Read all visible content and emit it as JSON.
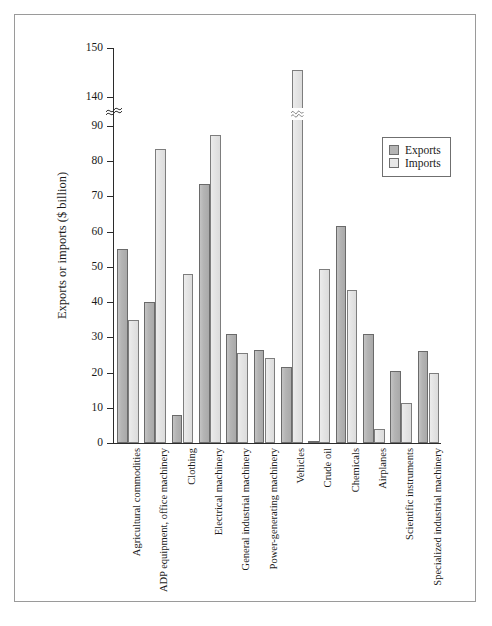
{
  "figure": {
    "y_axis_title": "Exports or imports ($ billion)"
  },
  "legend": {
    "position": "top-right",
    "items": [
      {
        "label": "Exports",
        "color": "#b4b4b4"
      },
      {
        "label": "Imports",
        "color": "#e8e8e8"
      }
    ]
  },
  "chart_data": {
    "type": "bar",
    "title": "",
    "xlabel": "",
    "ylabel": "Exports or imports ($ billion)",
    "ylim": [
      0,
      150
    ],
    "y_ticks": [
      0,
      10,
      20,
      30,
      40,
      50,
      60,
      70,
      80,
      90,
      140,
      150
    ],
    "y_tick_labels": [
      "0",
      "10",
      "20",
      "30",
      "40",
      "50",
      "60",
      "70",
      "80",
      "90",
      "140",
      "150"
    ],
    "axis_break": {
      "from": 90,
      "to": 140,
      "note": "y-axis broken between 90 and 140"
    },
    "grid": false,
    "legend_position": "top-right",
    "categories": [
      "Agricultural commodities",
      "ADP equipment, office machinery",
      "Clothing",
      "Electrical machinery",
      "General industrial machinery",
      "Power-generating machinery",
      "Vehicles",
      "Crude oil",
      "Chemicals",
      "Airplanes",
      "Scientific instruments",
      "Specialized industrial machinery"
    ],
    "series": [
      {
        "name": "Exports",
        "color": "#b4b4b4",
        "values": [
          55,
          40,
          8,
          73.5,
          31,
          26.5,
          21.5,
          0.5,
          61.5,
          31,
          20.5,
          26
        ]
      },
      {
        "name": "Imports",
        "color": "#e8e8e8",
        "values": [
          35,
          83.5,
          48,
          87.5,
          25.5,
          24,
          145.5,
          49.5,
          43.5,
          4,
          11.5,
          20
        ]
      }
    ]
  }
}
